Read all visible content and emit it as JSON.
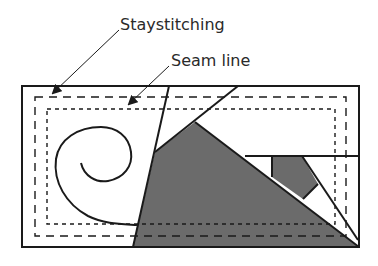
{
  "diagram": {
    "labels": {
      "staystitching": "Staystitching",
      "seam_line": "Seam line"
    },
    "colors": {
      "line": "#1a1a1a",
      "fill_gray": "#6b6b6b",
      "background": "#ffffff",
      "text": "#2a2a2a"
    }
  }
}
